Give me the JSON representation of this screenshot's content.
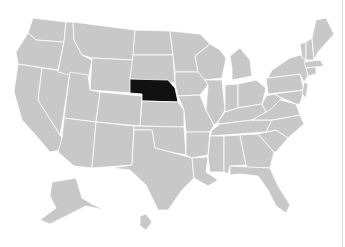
{
  "map": {
    "title": "United States",
    "highlighted_state": "Nebraska",
    "colors": {
      "background": "#ffffff",
      "state_fill": "#c8c8c8",
      "state_border": "#ffffff",
      "highlight_fill": "#111111"
    },
    "states": [
      {
        "name": "Washington",
        "d": "M33,18 L66,22 L64,42 L36,40 L28,33 Z"
      },
      {
        "name": "Oregon",
        "d": "M28,33 L36,40 L64,42 L58,70 L18,64 L16,52 Z"
      },
      {
        "name": "California",
        "d": "M18,64 L42,68 L38,100 L62,138 L62,150 L50,152 L40,140 L22,120 L14,92 Z"
      },
      {
        "name": "Nevada",
        "d": "M42,68 L70,72 L62,125 L60,135 L38,100 Z"
      },
      {
        "name": "Idaho",
        "d": "M66,22 L73,22 L74,40 L82,55 L92,60 L88,80 L58,72 L64,42 Z"
      },
      {
        "name": "Montana",
        "d": "M73,22 L135,30 L133,60 L92,58 L82,55 L74,40 Z"
      },
      {
        "name": "Wyoming",
        "d": "M92,58 L133,60 L131,93 L90,90 Z"
      },
      {
        "name": "Utah",
        "d": "M70,72 L88,75 L90,90 L100,92 L96,122 L64,118 Z"
      },
      {
        "name": "Colorado",
        "d": "M100,92 L142,96 L140,126 L96,122 Z"
      },
      {
        "name": "Arizona",
        "d": "M64,118 L96,122 L92,168 L74,166 L58,152 L62,138 Z"
      },
      {
        "name": "New Mexico",
        "d": "M96,122 L134,126 L132,165 L92,168 Z"
      },
      {
        "name": "North Dakota",
        "d": "M135,30 L170,31 L173,55 L133,55 Z"
      },
      {
        "name": "South Dakota",
        "d": "M133,55 L173,55 L175,83 L130,79 Z"
      },
      {
        "name": "Nebraska",
        "highlight": true,
        "d": "M130,79 L168,80 L175,88 L178,102 L142,101 L142,94 L130,93 Z"
      },
      {
        "name": "Kansas",
        "d": "M142,101 L178,102 L184,110 L184,127 L140,126 Z"
      },
      {
        "name": "Oklahoma",
        "d": "M134,126 L184,127 L186,155 L170,152 L155,148 L152,130 L134,130 Z"
      },
      {
        "name": "Texas",
        "d": "M134,130 L152,130 L155,148 L170,152 L192,158 L194,178 L182,190 L168,210 L158,210 L146,185 L130,170 L112,168 L132,165 Z"
      },
      {
        "name": "Minnesota",
        "d": "M170,31 L200,34 L210,44 L195,56 L198,72 L175,72 L173,55 Z"
      },
      {
        "name": "Iowa",
        "d": "M175,72 L200,72 L208,85 L200,95 L178,96 L175,83 Z"
      },
      {
        "name": "Missouri",
        "d": "M178,96 L200,95 L206,110 L214,125 L210,132 L186,132 L184,110 Z"
      },
      {
        "name": "Arkansas",
        "d": "M186,132 L210,132 L208,155 L192,158 L186,155 Z"
      },
      {
        "name": "Louisiana",
        "d": "M192,158 L208,157 L206,172 L218,180 L208,186 L194,178 Z"
      },
      {
        "name": "Wisconsin",
        "d": "M195,56 L210,44 L220,50 L226,58 L222,78 L205,80 L198,72 Z"
      },
      {
        "name": "Illinois",
        "d": "M205,80 L222,80 L225,110 L218,122 L214,125 L206,110 L208,85 Z"
      },
      {
        "name": "Michigan",
        "d": "M230,56 L240,48 L250,60 L252,76 L232,80 L232,68 Z"
      },
      {
        "name": "Indiana",
        "d": "M225,85 L238,84 L238,108 L225,112 Z"
      },
      {
        "name": "Ohio",
        "d": "M238,84 L256,80 L266,88 L262,104 L238,108 Z"
      },
      {
        "name": "Kentucky",
        "d": "M218,122 L225,112 L238,108 L262,104 L266,112 L252,120 L220,124 Z"
      },
      {
        "name": "Tennessee",
        "d": "M212,130 L220,124 L252,120 L272,120 L266,132 L210,136 Z"
      },
      {
        "name": "Mississippi",
        "d": "M210,136 L224,136 L224,172 L210,172 L208,157 Z"
      },
      {
        "name": "Alabama",
        "d": "M224,136 L240,135 L246,165 L230,166 L228,174 L224,172 Z"
      },
      {
        "name": "Georgia",
        "d": "M240,135 L258,134 L274,152 L270,168 L248,168 L246,165 Z"
      },
      {
        "name": "Florida",
        "d": "M230,166 L270,168 L278,186 L290,205 L286,213 L276,206 L268,190 L258,176 L240,174 L230,175 Z"
      },
      {
        "name": "South Carolina",
        "d": "M258,134 L276,130 L288,138 L276,152 L274,152 Z"
      },
      {
        "name": "North Carolina",
        "d": "M266,132 L272,120 L300,115 L304,124 L288,138 L276,130 Z"
      },
      {
        "name": "Virginia",
        "d": "M252,120 L266,112 L280,100 L296,104 L300,115 L272,120 Z"
      },
      {
        "name": "West Virginia",
        "d": "M262,104 L266,96 L274,94 L282,98 L270,110 L266,112 Z"
      },
      {
        "name": "Pennsylvania",
        "d": "M266,78 L300,74 L304,90 L268,94 Z"
      },
      {
        "name": "New York",
        "d": "M272,70 L290,58 L304,54 L308,76 L304,82 L300,74 L268,78 Z"
      },
      {
        "name": "Maryland",
        "d": "M274,94 L304,90 L300,104 L296,104 L282,98 Z"
      },
      {
        "name": "New Jersey",
        "d": "M304,82 L308,84 L306,98 L302,94 Z"
      },
      {
        "name": "Vermont",
        "d": "M300,44 L306,42 L306,60 L302,58 Z"
      },
      {
        "name": "New Hampshire",
        "d": "M306,42 L312,38 L314,60 L306,60 Z"
      },
      {
        "name": "Maine",
        "d": "M312,38 L316,20 L326,18 L334,34 L318,52 L314,60 Z"
      },
      {
        "name": "Massachusetts",
        "d": "M304,62 L320,60 L324,66 L306,68 Z"
      },
      {
        "name": "Connecticut",
        "d": "M306,68 L316,67 L316,74 L308,76 Z"
      },
      {
        "name": "Alaska",
        "d": "M52,182 L76,178 L82,198 L92,204 L104,210 L86,206 L70,214 L50,224 L40,220 L56,208 L50,196 Z"
      },
      {
        "name": "Hawaii",
        "d": "M140,216 L146,214 L152,222 L146,230 L140,226 Z"
      }
    ]
  }
}
